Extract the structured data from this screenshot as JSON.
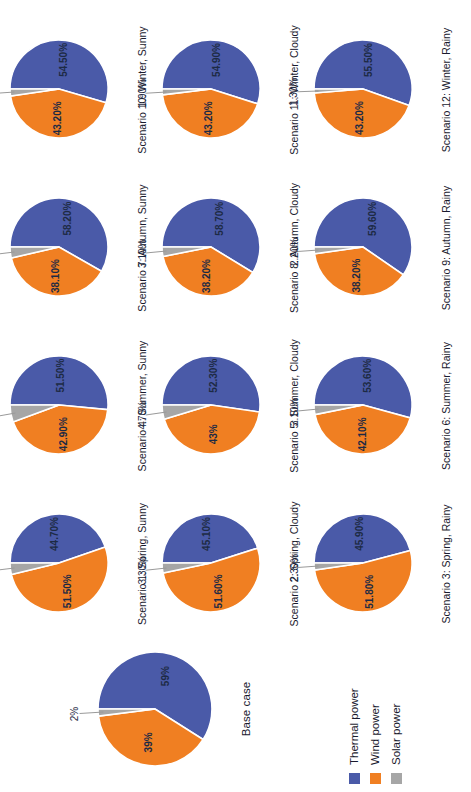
{
  "chart_data": {
    "type": "pie",
    "title": "",
    "legend": {
      "position": "left-bottom",
      "entries": [
        {
          "name": "Thermal power",
          "color": "#4a5aa8"
        },
        {
          "name": "Wind power",
          "color": "#f07f22"
        },
        {
          "name": "Solar power",
          "color": "#a6a6a6"
        }
      ]
    },
    "categories": [
      "Thermal power",
      "Wind power",
      "Solar power"
    ],
    "colors": [
      "#4a5aa8",
      "#f07f22",
      "#a6a6a6"
    ],
    "base_case": {
      "label": "Base case",
      "values": [
        59,
        39,
        2
      ],
      "labels": [
        "59%",
        "39%",
        "2%"
      ]
    },
    "panels": [
      {
        "label": "Scenario 1: Spring, Sunny",
        "values": [
          44.7,
          51.5,
          3.8
        ],
        "labels": [
          "44.70%",
          "51.50%",
          "3.80%"
        ]
      },
      {
        "label": "Scenario 2: Spring, Cloudy",
        "values": [
          45.1,
          51.6,
          3.3
        ],
        "labels": [
          "45.10%",
          "51.60%",
          "3.30%"
        ]
      },
      {
        "label": "Scenario 3: Spring, Rainy",
        "values": [
          45.9,
          51.8,
          2.3
        ],
        "labels": [
          "45.90%",
          "51.80%",
          "2.30%"
        ]
      },
      {
        "label": "Scenario 4: Summer, Sunny",
        "values": [
          51.5,
          42.9,
          5.6
        ],
        "labels": [
          "51.50%",
          "42.90%",
          "5.60%"
        ]
      },
      {
        "label": "Scenario 5: Summer, Cloudy",
        "values": [
          52.3,
          43.0,
          4.7
        ],
        "labels": [
          "52.30%",
          "43%",
          "4.70%"
        ]
      },
      {
        "label": "Scenario 6: Summer, Rainy",
        "values": [
          53.6,
          42.1,
          3.1
        ],
        "labels": [
          "53.60%",
          "42.10%",
          "3.10%"
        ]
      },
      {
        "label": "Scenario 7: Autumn, Sunny",
        "values": [
          58.2,
          38.1,
          3.6
        ],
        "labels": [
          "58.20%",
          "38.10%",
          "3.60%"
        ]
      },
      {
        "label": "Scenario 8: Autumn, Cloudy",
        "values": [
          58.7,
          38.2,
          3.1
        ],
        "labels": [
          "58.70%",
          "38.20%",
          "3.10%"
        ]
      },
      {
        "label": "Scenario 9: Autumn, Rainy",
        "values": [
          59.6,
          38.2,
          2.2
        ],
        "labels": [
          "59.60%",
          "38.20%",
          "2.20%"
        ]
      },
      {
        "label": "Scenario 10: Winter, Sunny",
        "values": [
          54.5,
          43.2,
          2.3
        ],
        "labels": [
          "54.50%",
          "43.20%",
          "2.30%"
        ]
      },
      {
        "label": "Scenario 11: Winter, Cloudy",
        "values": [
          54.9,
          43.2,
          1.9
        ],
        "labels": [
          "54.90%",
          "43.20%",
          "1.90%"
        ]
      },
      {
        "label": "Scenario 12: Winter, Rainy",
        "values": [
          55.5,
          43.2,
          1.3
        ],
        "labels": [
          "55.50%",
          "43.20%",
          "1.30%"
        ]
      }
    ]
  }
}
